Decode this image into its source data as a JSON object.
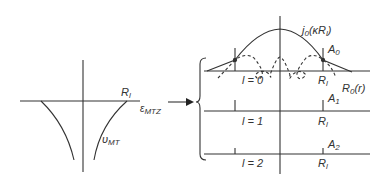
{
  "left_panel": {
    "radius_label": "R",
    "radius_sub": "l",
    "energy_label": "ε",
    "energy_sub": "MTZ",
    "potential_label": "υ",
    "potential_sub": "MT"
  },
  "arrow": {
    "direction": "right"
  },
  "right_panel": {
    "bessel_label": "j",
    "bessel_sub": "0",
    "bessel_arg": "(κR",
    "bessel_arg_sub": "l",
    "bessel_close": ")",
    "radial_label": "R",
    "radial_sub": "0",
    "radial_arg": "(r)",
    "rows": [
      {
        "l_label": "l = 0",
        "amp": "A",
        "amp_sub": "0",
        "r": "R",
        "r_sub": "l"
      },
      {
        "l_label": "l = 1",
        "amp": "A",
        "amp_sub": "1",
        "r": "R",
        "r_sub": "l"
      },
      {
        "l_label": "l = 2",
        "amp": "A",
        "amp_sub": "2",
        "r": "R",
        "r_sub": "l"
      }
    ]
  },
  "colors": {
    "line": "#333333",
    "background": "#ffffff"
  }
}
